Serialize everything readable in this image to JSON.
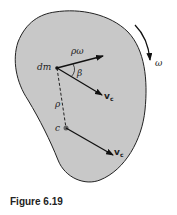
{
  "figure": {
    "caption": "Figure 6.19",
    "labels": {
      "dm": "dm",
      "rho_omega": "ρω",
      "beta": "β",
      "rho": "ρ",
      "c": "c",
      "vc_top": "v",
      "vc_top_sub": "c",
      "vc_bottom": "v",
      "vc_bottom_sub": "c",
      "omega": "ω"
    },
    "colors": {
      "body_fill": "#c8c8c8",
      "outline": "#222222",
      "arrow": "#111111",
      "background": "#ffffff"
    }
  }
}
